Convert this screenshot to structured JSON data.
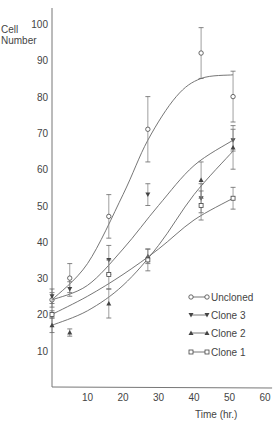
{
  "chart_data": {
    "type": "line",
    "title": "",
    "xlabel": "Time (hr.)",
    "ylabel": "Cell Number",
    "xlim": [
      0,
      60
    ],
    "ylim": [
      0,
      100
    ],
    "xticks": [
      10,
      20,
      30,
      40,
      50,
      60
    ],
    "yticks": [
      10,
      20,
      30,
      40,
      50,
      60,
      70,
      80,
      90,
      100
    ],
    "grid": false,
    "legend_position": "lower right",
    "series": [
      {
        "name": "Uncloned",
        "marker": "open-circle",
        "points": [
          {
            "x": 0,
            "y": 24,
            "err": 2
          },
          {
            "x": 5,
            "y": 30,
            "err": 4
          },
          {
            "x": 16,
            "y": 47,
            "err": 6
          },
          {
            "x": 27,
            "y": 71,
            "err": 9
          },
          {
            "x": 42,
            "y": 92,
            "err": 7
          },
          {
            "x": 51,
            "y": 80,
            "err": 7
          }
        ],
        "fit": [
          [
            0,
            24
          ],
          [
            10,
            34
          ],
          [
            20,
            53
          ],
          [
            27,
            68
          ],
          [
            35,
            80
          ],
          [
            42,
            85
          ],
          [
            51,
            86
          ]
        ]
      },
      {
        "name": "Clone 3",
        "marker": "filled-down-triangle",
        "points": [
          {
            "x": 0,
            "y": 25,
            "err": 2
          },
          {
            "x": 5,
            "y": 27,
            "err": 2
          },
          {
            "x": 16,
            "y": 35,
            "err": 4
          },
          {
            "x": 27,
            "y": 53,
            "err": 3
          },
          {
            "x": 42,
            "y": 52,
            "err": 4
          },
          {
            "x": 51,
            "y": 68,
            "err": 3
          }
        ],
        "fit": [
          [
            0,
            24
          ],
          [
            10,
            28
          ],
          [
            20,
            38
          ],
          [
            30,
            50
          ],
          [
            40,
            61
          ],
          [
            51,
            68
          ]
        ]
      },
      {
        "name": "Clone 2",
        "marker": "filled-up-triangle",
        "points": [
          {
            "x": 0,
            "y": 17,
            "err": 2
          },
          {
            "x": 5,
            "y": 15,
            "err": 1
          },
          {
            "x": 16,
            "y": 23,
            "err": 4
          },
          {
            "x": 27,
            "y": 36,
            "err": 2
          },
          {
            "x": 42,
            "y": 57,
            "err": 5
          },
          {
            "x": 51,
            "y": 66,
            "err": 6
          }
        ],
        "fit": [
          [
            0,
            17
          ],
          [
            10,
            21
          ],
          [
            20,
            28
          ],
          [
            30,
            39
          ],
          [
            40,
            53
          ],
          [
            51,
            65
          ]
        ]
      },
      {
        "name": "Clone 1",
        "marker": "open-square",
        "points": [
          {
            "x": 0,
            "y": 20,
            "err": 1
          },
          {
            "x": 16,
            "y": 31,
            "err": 4
          },
          {
            "x": 27,
            "y": 35,
            "err": 3
          },
          {
            "x": 42,
            "y": 50,
            "err": 4
          },
          {
            "x": 51,
            "y": 52,
            "err": 3
          }
        ],
        "fit": [
          [
            0,
            20
          ],
          [
            10,
            25
          ],
          [
            20,
            31
          ],
          [
            30,
            38
          ],
          [
            40,
            46
          ],
          [
            51,
            52
          ]
        ]
      }
    ]
  },
  "labels": {
    "y_axis": [
      "Cell",
      "Number"
    ],
    "x_axis": "Time (hr.)",
    "legend": [
      "Uncloned",
      "Clone 3",
      "Clone 2",
      "Clone 1"
    ]
  }
}
